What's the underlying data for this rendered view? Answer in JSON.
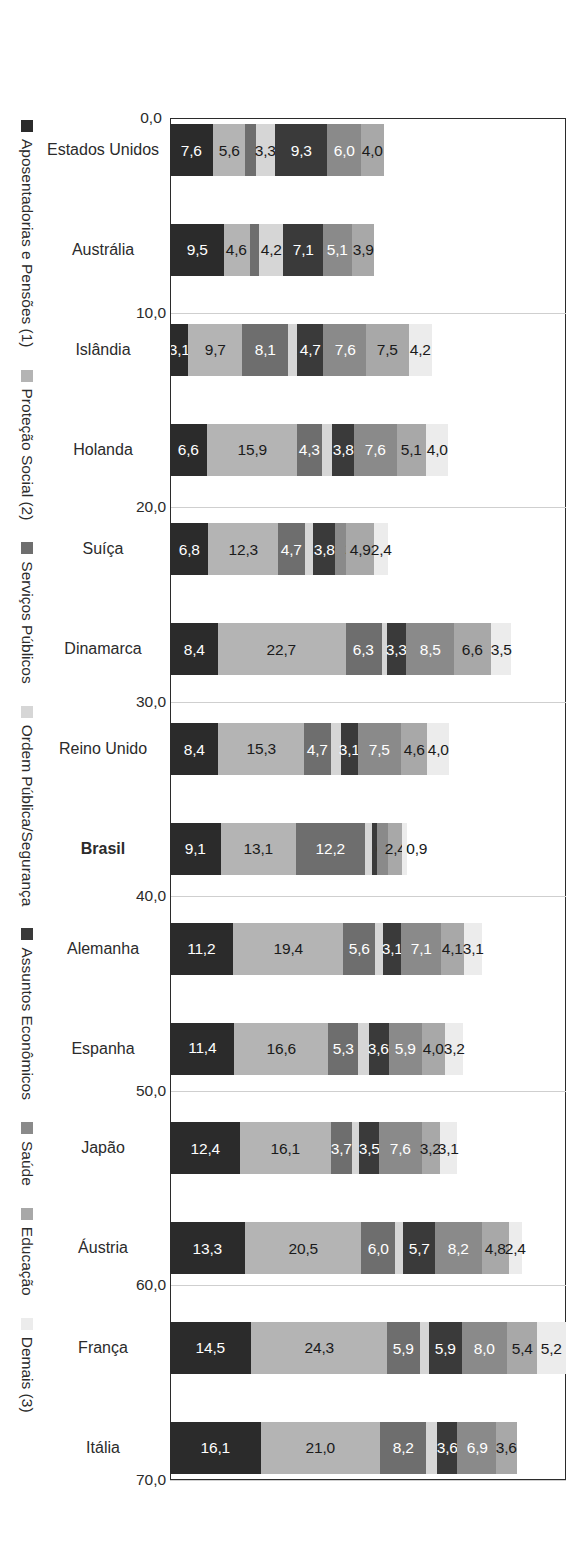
{
  "chart_data": {
    "type": "bar",
    "orientation": "vertical-stacked",
    "title": "",
    "subtitle": "",
    "xlabel": "",
    "ylabel": "",
    "ylim": [
      0,
      70
    ],
    "grid": true,
    "legend_position": "bottom",
    "axis_ticks": [
      "0,0",
      "10,0",
      "20,0",
      "30,0",
      "40,0",
      "50,0",
      "60,0",
      "70,0"
    ],
    "axis_tick_values": [
      0,
      10,
      20,
      30,
      40,
      50,
      60,
      70
    ],
    "highlight_category": "Brasil",
    "categories": [
      "Estados Unidos",
      "Austrália",
      "Islândia",
      "Holanda",
      "Suíça",
      "Dinamarca",
      "Reino Unido",
      "Brasil",
      "Alemanha",
      "Espanha",
      "Japão",
      "Áustria",
      "França",
      "Itália"
    ],
    "series": [
      {
        "name": "Aposentadorias e Pensões (1)",
        "color": "#2b2b2b",
        "values": [
          7.6,
          9.5,
          3.1,
          6.6,
          6.8,
          8.4,
          8.4,
          9.1,
          11.2,
          11.4,
          12.4,
          13.3,
          14.5,
          16.1
        ]
      },
      {
        "name": "Proteção Social (2)",
        "color": "#b4b4b4",
        "values": [
          5.6,
          4.6,
          9.7,
          15.9,
          12.3,
          22.7,
          15.3,
          13.1,
          19.4,
          16.6,
          16.1,
          20.5,
          24.3,
          21.0
        ]
      },
      {
        "name": "Serviços Públicos",
        "color": "#6e6e6e",
        "values": [
          2.0,
          1.7,
          8.1,
          4.3,
          4.7,
          6.3,
          4.7,
          12.2,
          5.6,
          5.3,
          3.7,
          6.0,
          5.9,
          8.2
        ]
      },
      {
        "name": "Ordem Pública/Segurança",
        "color": "#d6d6d6",
        "values": [
          3.3,
          4.2,
          1.5,
          1.9,
          1.5,
          1.0,
          1.8,
          1.3,
          1.5,
          1.8,
          1.2,
          1.4,
          1.6,
          1.9
        ]
      },
      {
        "name": "Assuntos Econômicos",
        "color": "#3a3a3a",
        "values": [
          9.3,
          7.1,
          4.7,
          3.8,
          3.8,
          3.3,
          3.1,
          0.9,
          3.1,
          3.6,
          3.5,
          5.7,
          5.9,
          3.6
        ]
      },
      {
        "name": "Saúde",
        "color": "#8a8a8a",
        "values": [
          6.0,
          5.1,
          7.6,
          7.6,
          2.1,
          8.5,
          7.5,
          2.0,
          7.1,
          5.9,
          7.6,
          8.2,
          8.0,
          6.9
        ]
      },
      {
        "name": "Educação",
        "color": "#a8a8a8",
        "values": [
          4.0,
          3.9,
          7.5,
          5.1,
          4.9,
          6.6,
          4.6,
          2.4,
          4.1,
          4.0,
          3.2,
          4.8,
          5.4,
          3.6
        ]
      },
      {
        "name": "Demais (3)",
        "color": "#ececec",
        "values": [
          0.0,
          0.0,
          4.2,
          4.0,
          2.4,
          3.5,
          4.0,
          0.9,
          3.1,
          3.2,
          3.1,
          2.4,
          5.2,
          0.0
        ]
      }
    ],
    "value_labels": {
      "Estados Unidos": [
        "7,6",
        "5,6",
        "2,0",
        "3,3",
        "9,3",
        "6,0",
        "4,0",
        ""
      ],
      "Austrália": [
        "9,5",
        "4,6",
        "1,7",
        "4,2",
        "7,1",
        "5,1",
        "3,9",
        ""
      ],
      "Islândia": [
        "3,1",
        "9,7",
        "8,1",
        "1,5",
        "4,7",
        "7,6",
        "7,5",
        "4,2"
      ],
      "Holanda": [
        "6,6",
        "15,9",
        "4,3",
        "1,9",
        "3,8",
        "7,6",
        "5,1",
        "4,0"
      ],
      "Suíça": [
        "6,8",
        "12,3",
        "4,7",
        "1,5",
        "3,8",
        "2,1",
        "4,9",
        "2,4"
      ],
      "Dinamarca": [
        "8,4",
        "22,7",
        "6,3",
        "1,0",
        "3,3",
        "8,5",
        "6,6",
        "3,5"
      ],
      "Reino Unido": [
        "8,4",
        "15,3",
        "4,7",
        "1,8",
        "3,1",
        "7,5",
        "4,6",
        "4,0"
      ],
      "Brasil": [
        "9,1",
        "13,1",
        "12,2",
        "1,3",
        "0,9",
        "2,0",
        "2,4",
        "0,9"
      ],
      "Alemanha": [
        "11,2",
        "19,4",
        "5,6",
        "1,5",
        "3,1",
        "7,1",
        "4,1",
        "3,1"
      ],
      "Espanha": [
        "11,4",
        "16,6",
        "5,3",
        "1,8",
        "3,6",
        "5,9",
        "4,0",
        "3,2"
      ],
      "Japão": [
        "12,4",
        "16,1",
        "3,7",
        "1,2",
        "3,5",
        "7,6",
        "3,2",
        "3,1"
      ],
      "Áustria": [
        "13,3",
        "20,5",
        "6,0",
        "1,4",
        "5,7",
        "8,2",
        "4,8",
        "2,4"
      ],
      "França": [
        "14,5",
        "24,3",
        "5,9",
        "1,6",
        "5,9",
        "8,0",
        "5,4",
        "5,2"
      ],
      "Itália": [
        "16,1",
        "21,0",
        "8,2",
        "1,9",
        "3,6",
        "6,9",
        "3,6",
        ""
      ]
    }
  }
}
